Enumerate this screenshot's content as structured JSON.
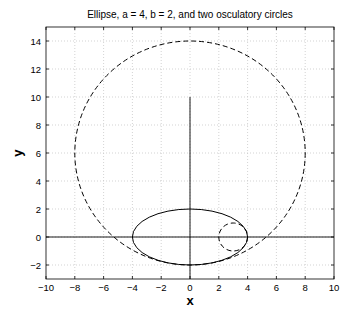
{
  "chart_data": {
    "type": "line",
    "title": "Ellipse, a = 4, b = 2, and two osculatory circles",
    "xlabel": "x",
    "ylabel": "y",
    "xlim": [
      -10,
      10
    ],
    "ylim": [
      -3,
      15
    ],
    "xticks": [
      -10,
      -8,
      -6,
      -4,
      -2,
      0,
      2,
      4,
      6,
      8,
      10
    ],
    "yticks": [
      -2,
      0,
      2,
      4,
      6,
      8,
      10,
      12,
      14
    ],
    "grid": true,
    "series": [
      {
        "name": "ellipse",
        "shape": "ellipse",
        "center": [
          0,
          0
        ],
        "a": 4,
        "b": 2,
        "style": "solid",
        "color": "#000000"
      },
      {
        "name": "osculatory circle at (4,0)",
        "shape": "circle",
        "center": [
          3,
          0
        ],
        "radius": 1,
        "style": "dashed",
        "color": "#000000"
      },
      {
        "name": "osculatory circle at (0,-2)",
        "shape": "circle",
        "center": [
          0,
          6
        ],
        "radius": 8,
        "style": "dashed",
        "color": "#000000"
      },
      {
        "name": "x-axis line",
        "shape": "line",
        "points": [
          [
            -10,
            0
          ],
          [
            10,
            0
          ]
        ],
        "style": "solid",
        "color": "#000000"
      },
      {
        "name": "y-axis line",
        "shape": "line",
        "points": [
          [
            0,
            -3
          ],
          [
            0,
            10
          ]
        ],
        "style": "solid",
        "color": "#000000"
      }
    ]
  }
}
